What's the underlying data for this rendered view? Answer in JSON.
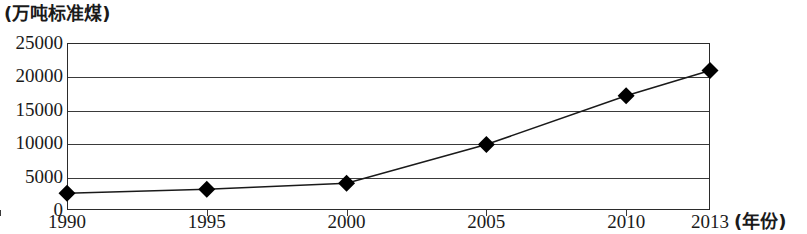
{
  "chart_data": {
    "type": "line",
    "title": "",
    "ylabel": "(万吨标准煤)",
    "xlabel": "(年份)",
    "x": [
      1990,
      1995,
      2000,
      2005,
      2010,
      2013
    ],
    "categories": [
      "1990",
      "1995",
      "2000",
      "2005",
      "2010",
      "2013"
    ],
    "values": [
      2500,
      3100,
      4000,
      9800,
      17100,
      20900
    ],
    "series": [
      {
        "name": "能源消费总量",
        "values": [
          2500,
          3100,
          4000,
          9800,
          17100,
          20900
        ]
      }
    ],
    "ylim": [
      0,
      25000
    ],
    "yticks": [
      0,
      5000,
      10000,
      15000,
      20000,
      25000
    ],
    "ytick_labels": [
      "0",
      "5000",
      "10000",
      "15000",
      "20000",
      "25000"
    ],
    "xlim": [
      1990,
      2013
    ],
    "xticks": [
      1990,
      1995,
      2000,
      2005,
      2010,
      2013
    ],
    "xtick_labels": [
      "1990",
      "1995",
      "2000",
      "2005",
      "2010",
      "2013"
    ],
    "grid": "horizontal",
    "legend": "none",
    "marker": "diamond",
    "line_color": "#1a1a1a",
    "marker_color": "#000000",
    "grid_color": "#3a3a3a",
    "background": "#ffffff"
  }
}
